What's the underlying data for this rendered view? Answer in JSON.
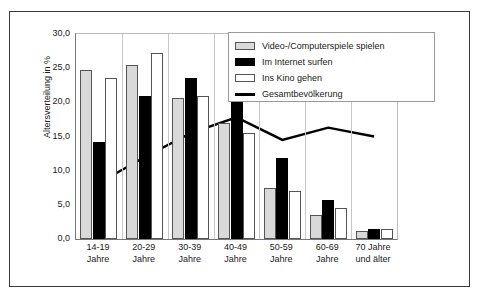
{
  "chart_data": {
    "type": "bar",
    "title": "",
    "xlabel": "",
    "ylabel": "Altersverteilung in %",
    "ylim": [
      0,
      30
    ],
    "ytick_labels": [
      "0,0",
      "5,0",
      "10,0",
      "15,0",
      "20,0",
      "25,0",
      "30,0"
    ],
    "ytick_values": [
      0,
      5,
      10,
      15,
      20,
      25,
      30
    ],
    "grid": false,
    "legend_position": "top-right",
    "categories": [
      "14-19 Jahre",
      "20-29 Jahre",
      "30-39 Jahre",
      "40-49 Jahre",
      "50-59 Jahre",
      "60-69 Jahre",
      "70 Jahre und älter"
    ],
    "category_lines": [
      [
        "14-19",
        "Jahre"
      ],
      [
        "20-29",
        "Jahre"
      ],
      [
        "30-39",
        "Jahre"
      ],
      [
        "40-49",
        "Jahre"
      ],
      [
        "50-59",
        "Jahre"
      ],
      [
        "60-69",
        "Jahre"
      ],
      [
        "70 Jahre",
        "und älter"
      ]
    ],
    "series": [
      {
        "name": "Video-/Computerspiele spielen",
        "type": "bar",
        "color": "#d9d9d9",
        "values": [
          24.7,
          25.5,
          20.7,
          17.0,
          7.5,
          3.5,
          1.2
        ]
      },
      {
        "name": "Im Internet surfen",
        "type": "bar",
        "color": "#000000",
        "values": [
          14.2,
          20.9,
          23.5,
          22.6,
          11.8,
          5.7,
          1.4
        ]
      },
      {
        "name": "Ins Kino gehen",
        "type": "bar",
        "color": "#ffffff",
        "values": [
          23.5,
          27.2,
          21.0,
          15.5,
          7.0,
          4.5,
          1.5
        ]
      },
      {
        "name": "Gesamtbevölkerung",
        "type": "line",
        "color": "#000000",
        "values": [
          8.2,
          12.0,
          15.5,
          17.8,
          14.5,
          16.3,
          15.0
        ]
      }
    ]
  }
}
